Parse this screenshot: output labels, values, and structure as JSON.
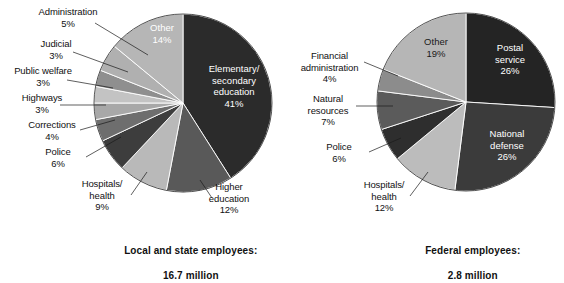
{
  "chart_data": [
    {
      "type": "pie",
      "id": "local-state",
      "title": "Local and state employees:",
      "subtitle": "16.7 million",
      "unit": "percent",
      "center": {
        "x": 183,
        "y": 103
      },
      "radius": 89,
      "start_angle_deg": 0,
      "direction": "clockwise",
      "categories": [
        "Elementary/\nsecondary\neducation",
        "Higher\neducation",
        "Hospitals/\nhealth",
        "Police",
        "Corrections",
        "Highways",
        "Public welfare",
        "Judicial",
        "Administration",
        "Other"
      ],
      "values": [
        41,
        12,
        9,
        6,
        4,
        3,
        3,
        3,
        5,
        14
      ],
      "value_labels": [
        "41%",
        "12%",
        "9%",
        "6%",
        "4%",
        "3%",
        "3%",
        "3%",
        "5%",
        "14%"
      ],
      "colors": [
        "#2b2b2b",
        "#595959",
        "#b9b9b9",
        "#3d3d3d",
        "#6e6e6e",
        "#a8a8a8",
        "#c3c3c3",
        "#8f8f8f",
        "#b0b0b0",
        "#b6b6b6"
      ]
    },
    {
      "type": "pie",
      "id": "federal",
      "title": "Federal employees:",
      "subtitle": "2.8 million",
      "unit": "percent",
      "center": {
        "x": 466,
        "y": 102
      },
      "radius": 89,
      "start_angle_deg": 0,
      "direction": "clockwise",
      "categories": [
        "Postal\nservice",
        "National\ndefense",
        "Hospitals/\nhealth",
        "Police",
        "Natural\nresources",
        "Financial\nadministration",
        "Other"
      ],
      "values": [
        26,
        26,
        12,
        6,
        7,
        4,
        19
      ],
      "value_labels": [
        "26%",
        "26%",
        "12%",
        "6%",
        "7%",
        "4%",
        "19%"
      ],
      "colors": [
        "#242424",
        "#3b3b3b",
        "#bcbcbc",
        "#2e2e2e",
        "#5b5b5b",
        "#8c8c8c",
        "#b6b6b6"
      ]
    }
  ],
  "left_chart": {
    "caption_line1": "Local and state employees:",
    "caption_line2": "16.7 million",
    "outside_labels": [
      {
        "name": "administration",
        "text": "Administration\n5%"
      },
      {
        "name": "judicial",
        "text": "Judicial\n3%"
      },
      {
        "name": "public-welfare",
        "text": "Public welfare\n3%"
      },
      {
        "name": "highways",
        "text": "Highways\n3%"
      },
      {
        "name": "corrections",
        "text": "Corrections\n4%"
      },
      {
        "name": "police",
        "text": "Police\n6%"
      },
      {
        "name": "hospitals-health",
        "text": "Hospitals/\nhealth\n9%"
      },
      {
        "name": "higher-education",
        "text": "Higher\neducation\n12%"
      }
    ],
    "inside_labels": [
      {
        "name": "other",
        "text": "Other\n14%"
      },
      {
        "name": "elementary-secondary-education",
        "text": "Elementary/\nsecondary\neducation\n41%"
      }
    ]
  },
  "right_chart": {
    "caption_line1": "Federal employees:",
    "caption_line2": "2.8 million",
    "outside_labels": [
      {
        "name": "financial-administration",
        "text": "Financial\nadministration\n4%"
      },
      {
        "name": "natural-resources",
        "text": "Natural\nresources\n7%"
      },
      {
        "name": "police",
        "text": "Police\n6%"
      },
      {
        "name": "hospitals-health",
        "text": "Hospitals/\nhealth\n12%"
      }
    ],
    "inside_labels": [
      {
        "name": "other",
        "text": "Other\n19%"
      },
      {
        "name": "postal-service",
        "text": "Postal\nservice\n26%"
      },
      {
        "name": "national-defense",
        "text": "National\ndefense\n26%"
      }
    ]
  }
}
